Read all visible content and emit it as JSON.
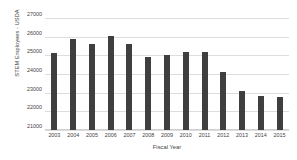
{
  "chart_data": {
    "type": "bar",
    "title": "",
    "xlabel": "Fiscal Year",
    "ylabel": "STEM Employees - USDA",
    "categories": [
      "2003",
      "2004",
      "2005",
      "2006",
      "2007",
      "2008",
      "2009",
      "2010",
      "2011",
      "2012",
      "2013",
      "2014",
      "2015"
    ],
    "values": [
      25100,
      25850,
      25600,
      26050,
      25600,
      24900,
      25000,
      25200,
      25200,
      24100,
      23100,
      22800,
      22750
    ],
    "ylim": [
      21000,
      27000
    ],
    "ytick_labels": [
      "27000",
      "26000",
      "25000",
      "24000",
      "23000",
      "22000",
      "21000"
    ],
    "ytick_values": [
      27000,
      26000,
      25000,
      24000,
      23000,
      22000,
      21000
    ],
    "grid": true,
    "legend": "none",
    "bar_color": "#3f3f3f",
    "gridline_color": "#dddddd",
    "background_color": "#ffffff"
  }
}
